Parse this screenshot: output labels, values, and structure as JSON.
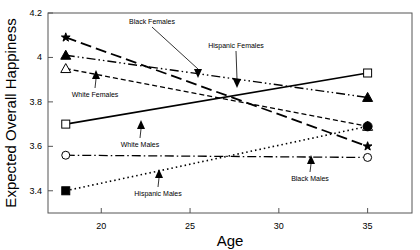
{
  "chart_data": {
    "type": "line",
    "title": "",
    "xlabel": "Age",
    "ylabel": "Expected Overall Happiness",
    "xlim": [
      17,
      37.5
    ],
    "ylim": [
      3.3,
      4.2
    ],
    "xticks": [
      20,
      25,
      30,
      35
    ],
    "yticks": [
      3.4,
      3.6,
      3.8,
      4,
      4.2
    ],
    "xtick_labels": [
      "20",
      "25",
      "30",
      "35"
    ],
    "ytick_labels": [
      "3.4",
      "3.6",
      "3.8",
      "4",
      "4.2"
    ],
    "grid": false,
    "legend": "inline-annotations",
    "x": [
      18,
      35
    ],
    "series": [
      {
        "name": "Black Females",
        "values": [
          4.09,
          3.6
        ],
        "marker": "star",
        "dash": "long-dash"
      },
      {
        "name": "Hispanic Females",
        "values": [
          4.01,
          3.82
        ],
        "marker": "filled-triangle",
        "dash": "dash-dot-dot"
      },
      {
        "name": "White Females",
        "values": [
          3.95,
          3.69
        ],
        "marker": "open-triangle",
        "dash": "short-dash"
      },
      {
        "name": "White Males",
        "values": [
          3.7,
          3.93
        ],
        "marker": "open-square",
        "dash": "solid"
      },
      {
        "name": "Black Males",
        "values": [
          3.56,
          3.55
        ],
        "marker": "open-circle",
        "dash": "dash-dot"
      },
      {
        "name": "Hispanic Males",
        "values": [
          3.4,
          3.69
        ],
        "marker": "filled-square",
        "dash": "dotted"
      }
    ],
    "annotations": [
      {
        "text": "Black Females",
        "label_x": 152,
        "label_y": 24,
        "tip_x": 198,
        "tip_y": 78
      },
      {
        "text": "Hispanic Females",
        "label_x": 236,
        "label_y": 48,
        "tip_x": 237,
        "tip_y": 88
      },
      {
        "text": "White Females",
        "label_x": 95,
        "label_y": 97,
        "tip_x": 96,
        "tip_y": 70
      },
      {
        "text": "White Males",
        "label_x": 140,
        "label_y": 147,
        "tip_x": 141,
        "tip_y": 120
      },
      {
        "text": "Hispanic Males",
        "label_x": 158,
        "label_y": 196,
        "tip_x": 159,
        "tip_y": 169
      },
      {
        "text": "Black Males",
        "label_x": 310,
        "label_y": 181,
        "tip_x": 311,
        "tip_y": 155
      }
    ],
    "colors": {
      "line": "#000000",
      "frame": "#555555",
      "background": "#ffffff"
    }
  }
}
